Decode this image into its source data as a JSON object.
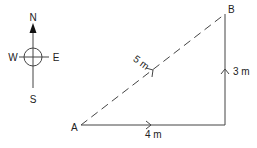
{
  "compass": {
    "north": "N",
    "south": "S",
    "west": "W",
    "east": "E"
  },
  "points": {
    "a": "A",
    "b": "B"
  },
  "segments": {
    "horizontal": "4 m",
    "vertical": "3 m",
    "diagonal": "5 m"
  },
  "colors": {
    "line": "#444444",
    "text": "#222222"
  }
}
